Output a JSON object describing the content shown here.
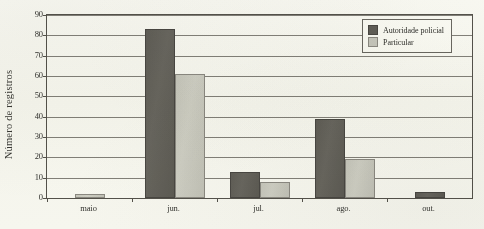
{
  "chart_data": {
    "type": "bar",
    "title": "",
    "xlabel": "",
    "ylabel": "Número de registros",
    "categories": [
      "maio",
      "jun.",
      "jul.",
      "ago.",
      "out."
    ],
    "series": [
      {
        "name": "Autoridade policial",
        "color": "#615f59",
        "values": [
          0,
          83,
          13,
          39,
          3
        ]
      },
      {
        "name": "Particular",
        "color": "#c9c9c1",
        "values": [
          2,
          61,
          8,
          19,
          0
        ]
      }
    ],
    "ylim": [
      0,
      90
    ],
    "yticks": [
      0,
      10,
      20,
      30,
      40,
      50,
      60,
      70,
      80,
      90
    ],
    "ytick_labels": [
      "0",
      "10",
      "20",
      "30",
      "40",
      "50",
      "60",
      "70",
      "80",
      "90"
    ],
    "grid": true,
    "legend_position": "top-right"
  }
}
